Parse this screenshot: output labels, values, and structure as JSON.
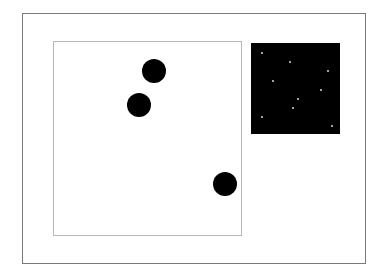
{
  "scene": {
    "outer_frame": {
      "x": 22,
      "y": 13,
      "w": 344,
      "h": 251,
      "border": "#7a7a7a"
    },
    "inner_panel": {
      "x": 53,
      "y": 41,
      "w": 189,
      "h": 195,
      "border": "#b8b8b8"
    },
    "discs": [
      {
        "cx": 154,
        "cy": 71,
        "r": 12,
        "color": "#000000"
      },
      {
        "cx": 139,
        "cy": 105,
        "r": 12,
        "color": "#000000"
      },
      {
        "cx": 225,
        "cy": 184,
        "r": 12,
        "color": "#000000"
      }
    ],
    "night_panel": {
      "x": 251,
      "y": 43,
      "w": 89,
      "h": 91,
      "color": "#000000",
      "stars": [
        {
          "x": 262,
          "y": 53
        },
        {
          "x": 290,
          "y": 62
        },
        {
          "x": 328,
          "y": 71
        },
        {
          "x": 273,
          "y": 81
        },
        {
          "x": 321,
          "y": 90
        },
        {
          "x": 298,
          "y": 99
        },
        {
          "x": 293,
          "y": 108
        },
        {
          "x": 262,
          "y": 117
        },
        {
          "x": 332,
          "y": 126
        }
      ],
      "star_color": "#d8d8d8"
    }
  }
}
